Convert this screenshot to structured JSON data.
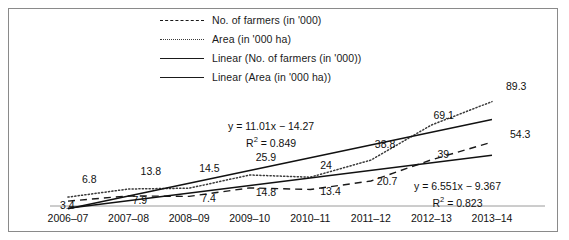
{
  "chart_data": {
    "type": "line",
    "title": "",
    "xlabel": "",
    "ylabel": "",
    "grid": false,
    "legend_position": "top-center",
    "categories": [
      "2006-07",
      "2007-08",
      "2008-09",
      "2009-10",
      "2010-11",
      "2011-12",
      "2012-13",
      "2013-14"
    ],
    "xlim": [
      0,
      7
    ],
    "ylim": [
      0,
      95
    ],
    "series": [
      {
        "name": "No. of farmers (in '000)",
        "style": "dashed",
        "values": [
          3.4,
          7.9,
          7.4,
          14.8,
          13.4,
          20.7,
          39,
          54.3
        ]
      },
      {
        "name": "Area (in '000 ha)",
        "style": "dotted",
        "values": [
          6.8,
          13.8,
          14.5,
          25.9,
          24,
          38.8,
          69.1,
          89.3
        ]
      },
      {
        "name": "Linear (No. of farmers (in '000))",
        "style": "solid",
        "trendline_for": "No. of farmers (in '000)",
        "equation": "y = 6.551x − 9.367",
        "r2": "R² = 0.823",
        "slope": 6.551,
        "intercept": -9.367
      },
      {
        "name": "Linear (Area (in '000 ha))",
        "style": "solid",
        "trendline_for": "Area (in '000 ha)",
        "equation": "y = 11.01x − 14.27",
        "r2": "R² = 0.849",
        "slope": 11.01,
        "intercept": -14.27
      }
    ],
    "point_labels": {
      "area": [
        "6.8",
        "13.8",
        "14.5",
        "25.9",
        "24",
        "38.8",
        "69.1",
        "89.3"
      ],
      "farmers": [
        "3.4",
        "7.9",
        "7.4",
        "14.8",
        "13.4",
        "20.7",
        "39",
        "54.3"
      ]
    }
  },
  "legend": {
    "items": [
      {
        "label": "No. of farmers (in '000)",
        "style": "dashed"
      },
      {
        "label": "Area (in '000 ha)",
        "style": "dotted"
      },
      {
        "label": "Linear (No. of farmers (in '000))",
        "style": "solid"
      },
      {
        "label": "Linear (Area (in '000 ha))",
        "style": "solid"
      }
    ]
  },
  "equations": {
    "area_trend": {
      "formula": "y = 11.01x − 14.27",
      "r2_prefix": "R",
      "r2_sup": "2",
      "r2_value": " = 0.849"
    },
    "farmers_trend": {
      "formula": "y = 6.551x − 9.367",
      "r2_prefix": "R",
      "r2_sup": "2",
      "r2_value": " = 0.823"
    }
  },
  "axis": {
    "x_ticks": [
      "2006-07",
      "2007-08",
      "2008-09",
      "2009-10",
      "2010-11",
      "2011-12",
      "2012-13",
      "2013-14"
    ]
  },
  "colors": {
    "frame": "#8a8a8a",
    "line": "#1a1a1a",
    "dotted": "#3a3a3a",
    "text": "#111111",
    "background": "#ffffff"
  }
}
